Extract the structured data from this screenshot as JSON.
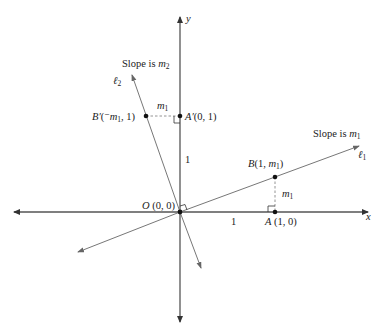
{
  "diagram": {
    "type": "coordinate-geometry",
    "axes": {
      "x_label": "x",
      "y_label": "y"
    },
    "lines": {
      "l1": {
        "label": "ℓ",
        "subscript": "1",
        "slope_text": "Slope is ",
        "slope_var": "m",
        "slope_sub": "1"
      },
      "l2": {
        "label": "ℓ",
        "subscript": "2",
        "slope_text": "Slope is ",
        "slope_var": "m",
        "slope_sub": "2"
      }
    },
    "points": {
      "O": {
        "name": "O",
        "coords": " (0, 0)"
      },
      "A": {
        "name": "A",
        "coords": " (1, 0)"
      },
      "B": {
        "name": "B",
        "coords_open": "(1, ",
        "coords_var": "m",
        "coords_sub": "1",
        "coords_close": ")"
      },
      "A_prime": {
        "name": "A′",
        "coords": "(0, 1)"
      },
      "B_prime": {
        "name": "B′",
        "coords_open": "(",
        "coords_neg": "⁻",
        "coords_var": "m",
        "coords_sub": "1",
        "coords_close": ", 1)"
      }
    },
    "segment_labels": {
      "x_unit": "1",
      "y_unit": "1",
      "vertical_m1_var": "m",
      "vertical_m1_sub": "1",
      "horizontal_m1_var": "m",
      "horizontal_m1_sub": "1"
    },
    "colors": {
      "axis": "#555555",
      "line": "#777777",
      "point": "#111111",
      "text": "#222222"
    }
  }
}
